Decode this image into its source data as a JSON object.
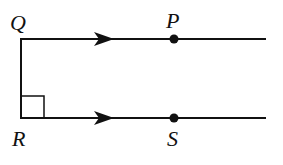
{
  "diagram": {
    "type": "geometry",
    "labels": {
      "Q": "Q",
      "P": "P",
      "R": "R",
      "S": "S"
    },
    "points": [
      {
        "name": "Q",
        "x": 21,
        "y": 39
      },
      {
        "name": "P",
        "x": 174,
        "y": 39,
        "marked": true
      },
      {
        "name": "R",
        "x": 21,
        "y": 118
      },
      {
        "name": "S",
        "x": 174,
        "y": 118,
        "marked": true
      }
    ],
    "annotations": [
      "parallel arrows on QP and RS",
      "right angle at R"
    ],
    "colors": {
      "stroke": "#111111",
      "background": "#ffffff"
    }
  }
}
